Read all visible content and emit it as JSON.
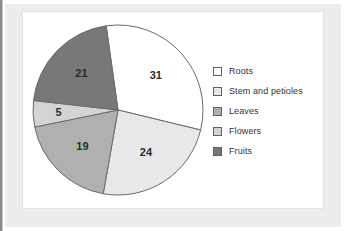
{
  "chart_data": {
    "type": "pie",
    "title": "",
    "subtitle": "",
    "xlabel": "",
    "ylabel": "",
    "grid": false,
    "legend_position": "right",
    "total": 100,
    "units": "percent",
    "start_angle_deg": -8,
    "direction": "clockwise",
    "categories": [
      "Roots",
      "Stem and petioles",
      "Leaves",
      "Flowers",
      "Fruits"
    ],
    "values": [
      31,
      24,
      19,
      5,
      21
    ],
    "slices": [
      {
        "label": "Roots",
        "value": 31,
        "display": "31",
        "color": "#ffffff",
        "edge": "#6b6b6b"
      },
      {
        "label": "Stem and petioles",
        "value": 24,
        "display": "24",
        "color": "#e8e8e8",
        "edge": "#6b6b6b"
      },
      {
        "label": "Leaves",
        "value": 19,
        "display": "19",
        "color": "#b0b0b0",
        "edge": "#6b6b6b"
      },
      {
        "label": "Flowers",
        "value": 5,
        "display": "5",
        "color": "#d4d4d4",
        "edge": "#6b6b6b"
      },
      {
        "label": "Fruits",
        "value": 21,
        "display": "21",
        "color": "#787878",
        "edge": "#6b6b6b"
      }
    ]
  },
  "legend": {
    "items": [
      {
        "label": "Roots",
        "color": "#ffffff"
      },
      {
        "label": "Stem and petioles",
        "color": "#e8e8e8"
      },
      {
        "label": "Leaves",
        "color": "#b0b0b0"
      },
      {
        "label": "Flowers",
        "color": "#d4d4d4"
      },
      {
        "label": "Fruits",
        "color": "#787878"
      }
    ]
  },
  "style": {
    "panel_background": "#ffffff",
    "mat_background": "#ededed",
    "panel_border": "#e2e2e2",
    "slice_outline": "#6b6b6b",
    "label_color": "#2b2b2b",
    "legend_text_color": "#333333"
  }
}
